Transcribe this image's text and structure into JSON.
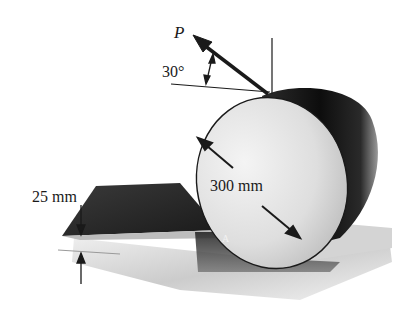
{
  "figure": {
    "labels": {
      "force": "P",
      "angle": "30°",
      "diameter": "300 mm",
      "step_height": "25 mm",
      "point": "A"
    },
    "colors": {
      "ink": "#1a1a1a",
      "ground_light": "#d6d6d6",
      "ground_dark": "#2a2a2a",
      "cylinder_face": "#e4e4e4",
      "cylinder_body": "#141414"
    }
  }
}
